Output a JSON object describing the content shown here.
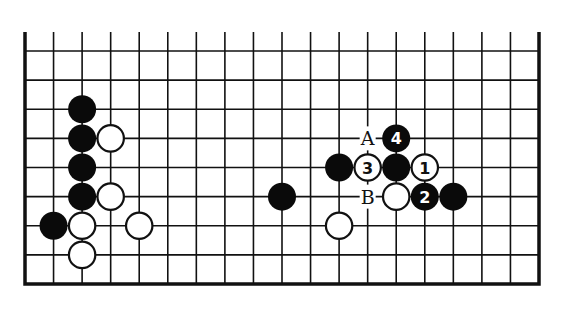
{
  "diagram": {
    "type": "go-board-fragment",
    "colors": {
      "background": "#ffffff",
      "line": "#111111",
      "black_stone": "#0a0a0a",
      "white_stone": "#ffffff"
    },
    "grid": {
      "columns": 19,
      "rows": 9,
      "edges": [
        "left",
        "right",
        "bottom"
      ],
      "open_edge": "top"
    },
    "stones": [
      {
        "color": "black",
        "col": 2,
        "row": 2,
        "label": ""
      },
      {
        "color": "black",
        "col": 2,
        "row": 3,
        "label": ""
      },
      {
        "color": "white",
        "col": 3,
        "row": 3,
        "label": ""
      },
      {
        "color": "black",
        "col": 2,
        "row": 4,
        "label": ""
      },
      {
        "color": "black",
        "col": 2,
        "row": 5,
        "label": ""
      },
      {
        "color": "white",
        "col": 3,
        "row": 5,
        "label": ""
      },
      {
        "color": "black",
        "col": 1,
        "row": 6,
        "label": ""
      },
      {
        "color": "white",
        "col": 2,
        "row": 6,
        "label": ""
      },
      {
        "color": "white",
        "col": 4,
        "row": 6,
        "label": ""
      },
      {
        "color": "white",
        "col": 2,
        "row": 7,
        "label": ""
      },
      {
        "color": "black",
        "col": 9,
        "row": 5,
        "label": ""
      },
      {
        "color": "white",
        "col": 11,
        "row": 6,
        "label": ""
      },
      {
        "color": "black",
        "col": 11,
        "row": 4,
        "label": ""
      },
      {
        "color": "white",
        "col": 12,
        "row": 4,
        "label": "3"
      },
      {
        "color": "black",
        "col": 13,
        "row": 4,
        "label": ""
      },
      {
        "color": "white",
        "col": 14,
        "row": 4,
        "label": "1"
      },
      {
        "color": "black",
        "col": 13,
        "row": 3,
        "label": "4"
      },
      {
        "color": "white",
        "col": 13,
        "row": 5,
        "label": ""
      },
      {
        "color": "black",
        "col": 14,
        "row": 5,
        "label": "2"
      },
      {
        "color": "black",
        "col": 15,
        "row": 5,
        "label": ""
      }
    ],
    "point_labels": [
      {
        "text": "A",
        "col": 12,
        "row": 3
      },
      {
        "text": "B",
        "col": 12,
        "row": 5
      }
    ]
  }
}
